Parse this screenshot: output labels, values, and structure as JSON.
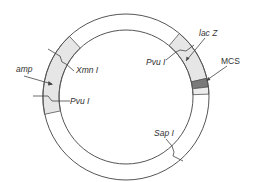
{
  "diagram": {
    "type": "plasmid-map",
    "colors": {
      "ring_stroke": "#555555",
      "gene_fill": "#e6e6e6",
      "mcs_fill": "#7a7a7a",
      "background": "#ffffff"
    },
    "labels": {
      "amp": "amp",
      "xmn": "Xmn I",
      "pvu_left": "Pvu I",
      "pvu_right": "Pvu I",
      "lacz": "lac Z",
      "mcs": "MCS",
      "sap": "Sap I"
    },
    "genes": [
      {
        "name": "amp",
        "start_deg": -133,
        "end_deg": 168,
        "style": "light"
      },
      {
        "name": "lac Z",
        "start_deg": -50,
        "end_deg": -13,
        "style": "light"
      },
      {
        "name": "MCS",
        "start_deg": -13,
        "end_deg": -7,
        "style": "dark"
      }
    ],
    "restriction_sites": [
      "Xmn I",
      "Pvu I",
      "Pvu I",
      "Sap I"
    ]
  }
}
